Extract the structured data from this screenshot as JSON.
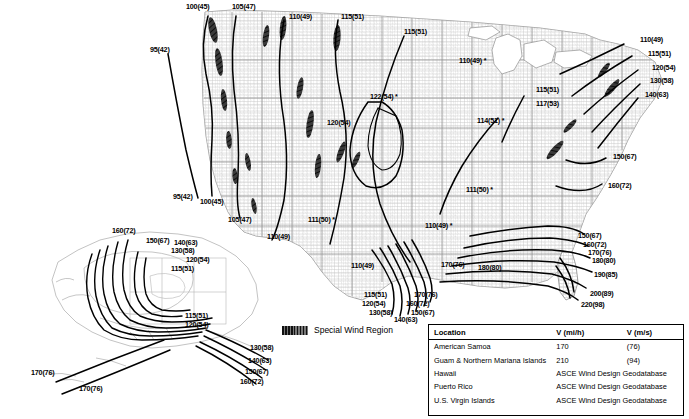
{
  "figure": {
    "type": "wind-speed-contour-map"
  },
  "legend": {
    "swatch_name": "special-wind-region-swatch",
    "label": "Special Wind Region"
  },
  "table": {
    "headers": [
      "Location",
      "V (mi/h)",
      "V (m/s)"
    ],
    "rows": [
      {
        "location": "American Samoa",
        "mih": "170",
        "ms": "(76)",
        "span": false
      },
      {
        "location": "Guam & Northern Mariana Islands",
        "mih": "210",
        "ms": "(94)",
        "span": false
      },
      {
        "location": "Hawaii",
        "mih": "ASCE Wind Design Geodatabase",
        "ms": "",
        "span": true
      },
      {
        "location": "Puerto Rico",
        "mih": "ASCE Wind Design Geodatabase",
        "ms": "",
        "span": true
      },
      {
        "location": "U.S. Virgin Islands",
        "mih": "ASCE Wind Design Geodatabase",
        "ms": "",
        "span": true
      }
    ]
  },
  "colors": {
    "contour": "#000000",
    "county_line": "#b9b9b9",
    "state_line": "#8a8a8a",
    "coast": "#6f6f6f",
    "special_region": "#2b2b2b",
    "background": "#ffffff"
  },
  "contour_labels_mainland": [
    {
      "id": "m1",
      "text": "100(45)",
      "star": false,
      "x": 186,
      "y": 3
    },
    {
      "id": "m2",
      "text": "105(47)",
      "star": false,
      "x": 232,
      "y": 3
    },
    {
      "id": "m3",
      "text": "110(49)",
      "star": false,
      "x": 289,
      "y": 13
    },
    {
      "id": "m4",
      "text": "115(51)",
      "star": false,
      "x": 341,
      "y": 13
    },
    {
      "id": "m5",
      "text": "115(51)",
      "star": false,
      "x": 404,
      "y": 28
    },
    {
      "id": "m6",
      "text": "110(49)",
      "star": true,
      "x": 459,
      "y": 57
    },
    {
      "id": "m7",
      "text": "95(42)",
      "star": false,
      "x": 150,
      "y": 46
    },
    {
      "id": "m8",
      "text": "110(49)",
      "star": false,
      "x": 640,
      "y": 36
    },
    {
      "id": "m9",
      "text": "115(51)",
      "star": false,
      "x": 648,
      "y": 50
    },
    {
      "id": "m10",
      "text": "120(54)",
      "star": false,
      "x": 652,
      "y": 64
    },
    {
      "id": "m11",
      "text": "130(58)",
      "star": false,
      "x": 650,
      "y": 77
    },
    {
      "id": "m12",
      "text": "140(63)",
      "star": false,
      "x": 645,
      "y": 91
    },
    {
      "id": "m13",
      "text": "122(54)",
      "star": true,
      "x": 370,
      "y": 93
    },
    {
      "id": "m14",
      "text": "120(54)",
      "star": false,
      "x": 327,
      "y": 119
    },
    {
      "id": "m15",
      "text": "114(51)",
      "star": true,
      "x": 477,
      "y": 117
    },
    {
      "id": "m16",
      "text": "115(51)",
      "star": false,
      "x": 536,
      "y": 86
    },
    {
      "id": "m17",
      "text": "117(53)",
      "star": false,
      "x": 536,
      "y": 100
    },
    {
      "id": "m18",
      "text": "150(67)",
      "star": false,
      "x": 613,
      "y": 153
    },
    {
      "id": "m19",
      "text": "160(72)",
      "star": false,
      "x": 608,
      "y": 182
    },
    {
      "id": "m20",
      "text": "111(50)",
      "star": true,
      "x": 466,
      "y": 186
    },
    {
      "id": "m21",
      "text": "95(42)",
      "star": false,
      "x": 173,
      "y": 193
    },
    {
      "id": "m22",
      "text": "100(45)",
      "star": false,
      "x": 200,
      "y": 198
    },
    {
      "id": "m23",
      "text": "105(47)",
      "star": false,
      "x": 228,
      "y": 216
    },
    {
      "id": "m24",
      "text": "111(50)",
      "star": true,
      "x": 308,
      "y": 216
    },
    {
      "id": "m25",
      "text": "110(49)",
      "star": false,
      "x": 267,
      "y": 233
    },
    {
      "id": "m26",
      "text": "110(49)",
      "star": true,
      "x": 425,
      "y": 222
    },
    {
      "id": "m27",
      "text": "110(49)",
      "star": false,
      "x": 351,
      "y": 262
    },
    {
      "id": "m28",
      "text": "170(76)",
      "star": false,
      "x": 441,
      "y": 261
    },
    {
      "id": "m29",
      "text": "180(80)",
      "star": false,
      "x": 478,
      "y": 264
    },
    {
      "id": "m30",
      "text": "115(51)",
      "star": false,
      "x": 364,
      "y": 291
    },
    {
      "id": "m31",
      "text": "120(54)",
      "star": false,
      "x": 362,
      "y": 300
    },
    {
      "id": "m32",
      "text": "130(58)",
      "star": false,
      "x": 369,
      "y": 309
    },
    {
      "id": "m33",
      "text": "140(63)",
      "star": false,
      "x": 394,
      "y": 316
    },
    {
      "id": "m34",
      "text": "150(67)",
      "star": false,
      "x": 411,
      "y": 309
    },
    {
      "id": "m35",
      "text": "160(72)",
      "star": false,
      "x": 406,
      "y": 300
    },
    {
      "id": "m36",
      "text": "170(76)",
      "star": false,
      "x": 414,
      "y": 291
    },
    {
      "id": "m37",
      "text": "150(67)",
      "star": false,
      "x": 578,
      "y": 232
    },
    {
      "id": "m38",
      "text": "160(72)",
      "star": false,
      "x": 583,
      "y": 241
    },
    {
      "id": "m39",
      "text": "170(76)",
      "star": false,
      "x": 588,
      "y": 249
    },
    {
      "id": "m40",
      "text": "180(80)",
      "star": false,
      "x": 592,
      "y": 257
    },
    {
      "id": "m41",
      "text": "190(85)",
      "star": false,
      "x": 594,
      "y": 271
    },
    {
      "id": "m42",
      "text": "200(89)",
      "star": false,
      "x": 590,
      "y": 290
    },
    {
      "id": "m43",
      "text": "220(98)",
      "star": false,
      "x": 581,
      "y": 301
    }
  ],
  "contour_labels_alaska": [
    {
      "id": "a1",
      "text": "160(72)",
      "x": 112,
      "y": 227
    },
    {
      "id": "a2",
      "text": "150(67)",
      "x": 146,
      "y": 237
    },
    {
      "id": "a3",
      "text": "140(63)",
      "x": 174,
      "y": 239
    },
    {
      "id": "a4",
      "text": "130(58)",
      "x": 171,
      "y": 247
    },
    {
      "id": "a5",
      "text": "120(54)",
      "x": 186,
      "y": 256
    },
    {
      "id": "a6",
      "text": "115(51)",
      "x": 171,
      "y": 265
    },
    {
      "id": "a7",
      "text": "115(51)",
      "x": 185,
      "y": 312
    },
    {
      "id": "a8",
      "text": "120(54)",
      "x": 185,
      "y": 321
    },
    {
      "id": "a9",
      "text": "130(58)",
      "x": 250,
      "y": 344
    },
    {
      "id": "a10",
      "text": "140(63)",
      "x": 248,
      "y": 357
    },
    {
      "id": "a11",
      "text": "150(67)",
      "x": 245,
      "y": 368
    },
    {
      "id": "a12",
      "text": "160(72)",
      "x": 240,
      "y": 378
    },
    {
      "id": "a13",
      "text": "170(76)",
      "x": 31,
      "y": 369
    },
    {
      "id": "a14",
      "text": "170(76)",
      "x": 79,
      "y": 385
    }
  ]
}
